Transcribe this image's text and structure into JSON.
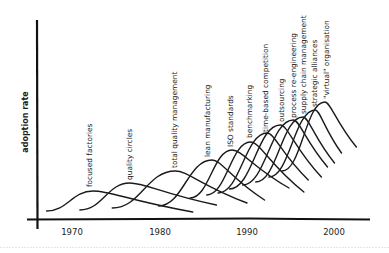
{
  "chart_data": {
    "type": "line",
    "title": "",
    "xlabel": "",
    "ylabel": "adoption rate",
    "x_ticks": [
      1970,
      1980,
      1990,
      2000
    ],
    "xlim": [
      1966,
      2005
    ],
    "ylim": [
      0,
      100
    ],
    "grid": false,
    "legend": "inline labels (rotated, above each peak)",
    "series": [
      {
        "name": "focused factories",
        "start": [
          1967.1,
          4
        ],
        "peak": [
          1972.4,
          14
        ],
        "end": [
          1983.8,
          3.5
        ]
      },
      {
        "name": "quality circles",
        "start": [
          1970.9,
          4.5
        ],
        "peak": [
          1976.6,
          18
        ],
        "end": [
          1986.5,
          7
        ]
      },
      {
        "name": "total quality management",
        "start": [
          1974.6,
          5.5
        ],
        "peak": [
          1981.8,
          24
        ],
        "end": [
          1990.0,
          8
        ]
      },
      {
        "name": "lean manufacturing",
        "start": [
          1979.9,
          6.5
        ],
        "peak": [
          1986.0,
          29.5
        ],
        "end": [
          1992.0,
          9.5
        ]
      },
      {
        "name": "ISO standards",
        "start": [
          1983.5,
          10.5
        ],
        "peak": [
          1988.3,
          34.5
        ],
        "end": [
          1994.8,
          15.5
        ]
      },
      {
        "name": "benchmarking",
        "start": [
          1985.4,
          12
        ],
        "peak": [
          1990.4,
          38.5
        ],
        "end": [
          1996.5,
          13.5
        ]
      },
      {
        "name": "time-based competition",
        "start": [
          1986.7,
          13
        ],
        "peak": [
          1992.3,
          43
        ],
        "end": [
          1997.0,
          19.5
        ]
      },
      {
        "name": "outsourcing",
        "start": [
          1988.0,
          15
        ],
        "peak": [
          1993.8,
          47
        ],
        "end": [
          1998.5,
          21
        ]
      },
      {
        "name": "process re-engineering",
        "start": [
          1989.5,
          17
        ],
        "peak": [
          1995.3,
          49.5
        ],
        "end": [
          1999.2,
          26
        ]
      },
      {
        "name": "supply chain management",
        "start": [
          1991.0,
          18.5
        ],
        "peak": [
          1996.4,
          51
        ],
        "end": [
          2000.0,
          28
        ]
      },
      {
        "name": "strategic alliances",
        "start": [
          1992.5,
          21
        ],
        "peak": [
          1997.8,
          54.5
        ],
        "end": [
          2000.8,
          33
        ]
      },
      {
        "name": "\"virtual\" organisation",
        "start": [
          1994.0,
          24
        ],
        "peak": [
          1998.9,
          58.5
        ],
        "end": [
          2002.5,
          36
        ]
      }
    ],
    "labels": [
      {
        "text": "focused factories",
        "x": 89,
        "y": 187
      },
      {
        "text": "quality circles",
        "x": 129,
        "y": 180
      },
      {
        "text": "total quality management",
        "x": 174,
        "y": 168
      },
      {
        "text": "lean manufacturing",
        "x": 207,
        "y": 157
      },
      {
        "text": "ISO standards",
        "x": 230,
        "y": 147
      },
      {
        "text": "benchmarking",
        "x": 249,
        "y": 138
      },
      {
        "text": "time-based competition",
        "x": 265,
        "y": 132
      },
      {
        "text": "outsourcing",
        "x": 281,
        "y": 122
      },
      {
        "text": "process re-engineering",
        "x": 293,
        "y": 118
      },
      {
        "text": "supply chain management",
        "x": 303,
        "y": 114
      },
      {
        "text": "strategic alliances",
        "x": 314,
        "y": 107
      },
      {
        "text": "\"virtual\" organisation",
        "x": 326,
        "y": 99
      }
    ]
  },
  "axes": {
    "y_label": "adoption rate",
    "x_tick_labels": [
      "1970",
      "1980",
      "1990",
      "2000"
    ]
  }
}
